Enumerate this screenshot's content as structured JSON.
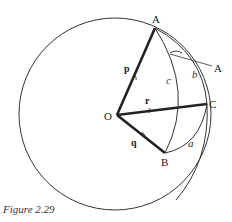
{
  "figure": {
    "caption": "Figure 2.29",
    "sphere": {
      "cx": 115,
      "cy": 114,
      "r": 96
    },
    "points": {
      "O": {
        "label": "O",
        "x": 117,
        "y": 115
      },
      "A": {
        "label": "A",
        "x": 155,
        "y": 28
      },
      "B": {
        "label": "B",
        "x": 165,
        "y": 153
      },
      "C": {
        "label": "C",
        "x": 207,
        "y": 104
      }
    },
    "vectors": {
      "p": {
        "label": "p",
        "from": "O",
        "to": "A"
      },
      "q": {
        "label": "q",
        "from": "O",
        "to": "B"
      },
      "r": {
        "label": "r",
        "from": "O",
        "to": "C"
      }
    },
    "arcs": {
      "a": {
        "label": "a",
        "between": [
          "B",
          "C"
        ]
      },
      "b": {
        "label": "b",
        "between": [
          "A",
          "C"
        ]
      },
      "c": {
        "label": "c",
        "between": [
          "A",
          "B"
        ]
      }
    },
    "angle_label": {
      "label": "A",
      "description": "spherical angle at vertex A"
    }
  }
}
